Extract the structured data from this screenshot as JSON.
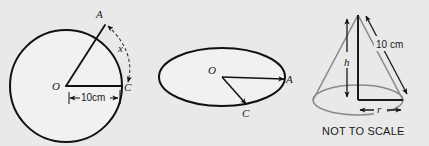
{
  "canvas": {
    "width": 429,
    "height": 146,
    "background": "#e9e9e9",
    "shape_fill": "#f1f1f1",
    "stroke_dark": "#111111",
    "stroke_gray": "#8a8a8a"
  },
  "figures": [
    {
      "id": "sector-circle",
      "type": "circle-with-sector",
      "center_label": "O",
      "point_labels": [
        "A",
        "C"
      ],
      "radius_label": "10cm",
      "arc_label": "x",
      "description": "Circle centre O with radii OA and OC, dashed arc from A to C labelled x, radius marked 10cm"
    },
    {
      "id": "cone-base-ellipse",
      "type": "ellipse-with-radii",
      "center_label": "O",
      "point_labels": [
        "A",
        "C"
      ],
      "description": "Ellipse (circle in perspective) centre O with arrows to A on the rim and C on the rim"
    },
    {
      "id": "cone",
      "type": "cone",
      "height_label": "h",
      "slant_label": "10 cm",
      "radius_label": "r",
      "note": "NOT TO SCALE",
      "description": "Cone with vertical height h, slant height 10 cm and base radius r"
    }
  ],
  "labels": {
    "circle_O": "O",
    "circle_A": "A",
    "circle_C": "C",
    "circle_radius": "10cm",
    "circle_arc_x": "x",
    "ellipse_O": "O",
    "ellipse_A": "A",
    "ellipse_C": "C",
    "cone_h": "h",
    "cone_slant": "10 cm",
    "cone_r": "r",
    "cone_note": "NOT TO SCALE"
  }
}
